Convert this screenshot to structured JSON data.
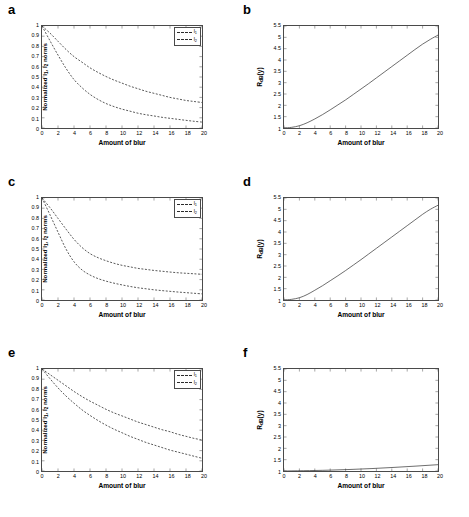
{
  "figure": {
    "panels": [
      {
        "letter": "a",
        "kind": "norm",
        "xlabel": "Amount of blur",
        "ylabel_html": "Normalized l<sub>1</sub>, l<sub>2</sub> norms",
        "xticks": [
          "0",
          "2",
          "4",
          "6",
          "8",
          "10",
          "12",
          "14",
          "16",
          "18",
          "20"
        ],
        "yticks": [
          "0",
          "0.1",
          "0.2",
          "0.3",
          "0.4",
          "0.5",
          "0.6",
          "0.7",
          "0.8",
          "0.9",
          "1"
        ],
        "legend": [
          {
            "label_html": "l<sub>1</sub>",
            "style": "dashed"
          },
          {
            "label_html": "l<sub>2</sub>",
            "style": "dashed"
          }
        ]
      },
      {
        "letter": "b",
        "kind": "ratio",
        "xlabel": "Amount of blur",
        "ylabel_html": "R<sub>dB</sub>(y)",
        "xticks": [
          "0",
          "2",
          "4",
          "6",
          "8",
          "10",
          "12",
          "14",
          "16",
          "18",
          "20"
        ],
        "yticks": [
          "1",
          "1.5",
          "2",
          "2.5",
          "3",
          "3.5",
          "4",
          "4.5",
          "5",
          "5.5"
        ]
      },
      {
        "letter": "c",
        "kind": "norm",
        "xlabel": "Amount of blur",
        "ylabel_html": "Normalized l<sub>1</sub>, l<sub>2</sub> norms",
        "xticks": [
          "0",
          "2",
          "4",
          "6",
          "8",
          "10",
          "12",
          "14",
          "16",
          "18",
          "20"
        ],
        "yticks": [
          "0",
          "0.1",
          "0.2",
          "0.3",
          "0.4",
          "0.5",
          "0.6",
          "0.7",
          "0.8",
          "0.9",
          "1"
        ],
        "legend": [
          {
            "label_html": "l<sub>1</sub>",
            "style": "dashed"
          },
          {
            "label_html": "l<sub>2</sub>",
            "style": "dashed"
          }
        ]
      },
      {
        "letter": "d",
        "kind": "ratio",
        "xlabel": "Amount of blur",
        "ylabel_html": "R<sub>dB</sub>(y)",
        "xticks": [
          "0",
          "2",
          "4",
          "6",
          "8",
          "10",
          "12",
          "14",
          "16",
          "18",
          "20"
        ],
        "yticks": [
          "1",
          "1.5",
          "2",
          "2.5",
          "3",
          "3.5",
          "4",
          "4.5",
          "5",
          "5.5"
        ]
      },
      {
        "letter": "e",
        "kind": "norm",
        "xlabel": "Amount of blur",
        "ylabel_html": "Normalized l<sub>1</sub>, l<sub>2</sub> norms",
        "xticks": [
          "0",
          "2",
          "4",
          "6",
          "8",
          "10",
          "12",
          "14",
          "16",
          "18",
          "20"
        ],
        "yticks": [
          "0",
          "0.1",
          "0.2",
          "0.3",
          "0.4",
          "0.5",
          "0.6",
          "0.7",
          "0.8",
          "0.9",
          "1"
        ],
        "legend": [
          {
            "label_html": "l<sub>1</sub>",
            "style": "dashed"
          },
          {
            "label_html": "l<sub>2</sub>",
            "style": "dashed"
          }
        ]
      },
      {
        "letter": "f",
        "kind": "ratio",
        "xlabel": "Amount of blur",
        "ylabel_html": "R<sub>dB</sub>(y)",
        "xticks": [
          "0",
          "2",
          "4",
          "6",
          "8",
          "10",
          "12",
          "14",
          "16",
          "18",
          "20"
        ],
        "yticks": [
          "1",
          "1.5",
          "2",
          "2.5",
          "3",
          "3.5",
          "4",
          "4.5",
          "5",
          "5.5"
        ]
      }
    ]
  },
  "colors": {
    "axis": "#4a4a4a",
    "curve": "#2b2b2b",
    "background": "#ffffff"
  },
  "chart_data": [
    {
      "type": "line",
      "panel": "a",
      "title": "",
      "xlabel": "Amount of blur",
      "ylabel": "Normalized l1, l2 norms",
      "xlim": [
        0,
        20
      ],
      "ylim": [
        0,
        1
      ],
      "grid": false,
      "legend_position": "top-right",
      "x": [
        0,
        1,
        2,
        3,
        4,
        5,
        6,
        7,
        8,
        9,
        10,
        11,
        12,
        13,
        14,
        15,
        16,
        17,
        18,
        19,
        20
      ],
      "series": [
        {
          "name": "l1",
          "linestyle": "dashed",
          "values": [
            1.0,
            0.93,
            0.85,
            0.77,
            0.7,
            0.645,
            0.59,
            0.545,
            0.505,
            0.47,
            0.44,
            0.41,
            0.385,
            0.36,
            0.34,
            0.32,
            0.3,
            0.285,
            0.27,
            0.26,
            0.25
          ]
        },
        {
          "name": "l2",
          "linestyle": "dashed",
          "values": [
            1.0,
            0.855,
            0.715,
            0.585,
            0.475,
            0.395,
            0.33,
            0.28,
            0.24,
            0.21,
            0.185,
            0.165,
            0.145,
            0.13,
            0.118,
            0.105,
            0.095,
            0.085,
            0.075,
            0.066,
            0.058
          ]
        }
      ]
    },
    {
      "type": "line",
      "panel": "b",
      "title": "",
      "xlabel": "Amount of blur",
      "ylabel": "RdB(y)",
      "xlim": [
        0,
        20
      ],
      "ylim": [
        1,
        5.5
      ],
      "grid": false,
      "x": [
        0,
        1,
        2,
        3,
        4,
        5,
        6,
        7,
        8,
        9,
        10,
        11,
        12,
        13,
        14,
        15,
        16,
        17,
        18,
        19,
        20
      ],
      "series": [
        {
          "name": "RdB",
          "linestyle": "solid",
          "values": [
            1.0,
            1.03,
            1.1,
            1.23,
            1.4,
            1.59,
            1.8,
            2.02,
            2.24,
            2.48,
            2.72,
            2.96,
            3.21,
            3.46,
            3.71,
            3.96,
            4.21,
            4.46,
            4.7,
            4.91,
            5.1
          ]
        }
      ]
    },
    {
      "type": "line",
      "panel": "c",
      "title": "",
      "xlabel": "Amount of blur",
      "ylabel": "Normalized l1, l2 norms",
      "xlim": [
        0,
        20
      ],
      "ylim": [
        0,
        1
      ],
      "grid": false,
      "legend_position": "top-right",
      "x": [
        0,
        1,
        2,
        3,
        4,
        5,
        6,
        7,
        8,
        9,
        10,
        11,
        12,
        13,
        14,
        15,
        16,
        17,
        18,
        19,
        20
      ],
      "series": [
        {
          "name": "l1",
          "linestyle": "dashed",
          "values": [
            1.0,
            0.905,
            0.8,
            0.695,
            0.595,
            0.515,
            0.455,
            0.415,
            0.385,
            0.36,
            0.34,
            0.325,
            0.31,
            0.3,
            0.29,
            0.282,
            0.274,
            0.267,
            0.262,
            0.257,
            0.252
          ]
        },
        {
          "name": "l2",
          "linestyle": "dashed",
          "values": [
            1.0,
            0.835,
            0.665,
            0.5,
            0.375,
            0.295,
            0.245,
            0.21,
            0.185,
            0.165,
            0.148,
            0.133,
            0.12,
            0.11,
            0.1,
            0.092,
            0.085,
            0.078,
            0.072,
            0.066,
            0.06
          ]
        }
      ]
    },
    {
      "type": "line",
      "panel": "d",
      "title": "",
      "xlabel": "Amount of blur",
      "ylabel": "RdB(y)",
      "xlim": [
        0,
        20
      ],
      "ylim": [
        1,
        5.5
      ],
      "grid": false,
      "x": [
        0,
        1,
        2,
        3,
        4,
        5,
        6,
        7,
        8,
        9,
        10,
        11,
        12,
        13,
        14,
        15,
        16,
        17,
        18,
        19,
        20
      ],
      "series": [
        {
          "name": "RdB",
          "linestyle": "solid",
          "values": [
            1.0,
            1.03,
            1.1,
            1.24,
            1.43,
            1.63,
            1.85,
            2.07,
            2.3,
            2.54,
            2.78,
            3.03,
            3.28,
            3.53,
            3.78,
            4.03,
            4.28,
            4.53,
            4.78,
            5.0,
            5.18
          ]
        }
      ]
    },
    {
      "type": "line",
      "panel": "e",
      "title": "",
      "xlabel": "Amount of blur",
      "ylabel": "Normalized l1, l2 norms",
      "xlim": [
        0,
        20
      ],
      "ylim": [
        0,
        1
      ],
      "grid": false,
      "legend_position": "top-right",
      "x": [
        0,
        1,
        2,
        3,
        4,
        5,
        6,
        7,
        8,
        9,
        10,
        11,
        12,
        13,
        14,
        15,
        16,
        17,
        18,
        19,
        20
      ],
      "series": [
        {
          "name": "l1",
          "linestyle": "dashed",
          "values": [
            1.0,
            0.945,
            0.89,
            0.835,
            0.78,
            0.73,
            0.685,
            0.645,
            0.605,
            0.57,
            0.54,
            0.51,
            0.48,
            0.455,
            0.43,
            0.405,
            0.385,
            0.36,
            0.34,
            0.32,
            0.305
          ]
        },
        {
          "name": "l2",
          "linestyle": "dashed",
          "values": [
            1.0,
            0.905,
            0.815,
            0.735,
            0.665,
            0.6,
            0.545,
            0.495,
            0.45,
            0.41,
            0.375,
            0.34,
            0.31,
            0.28,
            0.255,
            0.23,
            0.205,
            0.185,
            0.165,
            0.145,
            0.125
          ]
        }
      ]
    },
    {
      "type": "line",
      "panel": "f",
      "title": "",
      "xlabel": "Amount of blur",
      "ylabel": "RdB(y)",
      "xlim": [
        0,
        3.5
      ],
      "ylim": [
        1,
        3.5
      ],
      "grid": false,
      "x": [
        0,
        1,
        2,
        3,
        4,
        5,
        6,
        7,
        8,
        9,
        10,
        11,
        12,
        13,
        14,
        15,
        16,
        17,
        18,
        19,
        20
      ],
      "series": [
        {
          "name": "RdB",
          "linestyle": "solid",
          "values": [
            1.0,
            1.02,
            1.06,
            1.12,
            1.19,
            1.27,
            1.36,
            1.46,
            1.57,
            1.68,
            1.8,
            1.93,
            2.06,
            2.19,
            2.33,
            2.47,
            2.61,
            2.75,
            2.89,
            3.02,
            3.15
          ]
        }
      ]
    }
  ]
}
